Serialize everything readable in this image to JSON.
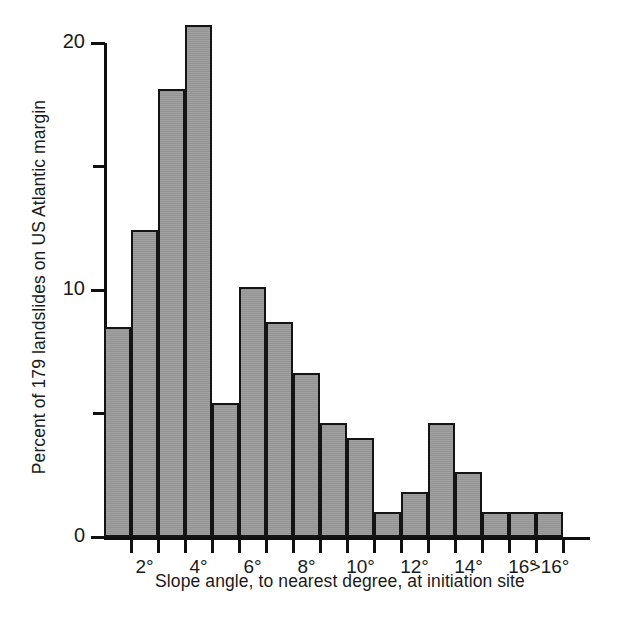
{
  "chart_data": {
    "type": "bar",
    "title": "",
    "subtitle": "",
    "xlabel": "Slope angle, to nearest degree, at initiation site",
    "ylabel": "Percent of 179 landslides on US Atlantic margin",
    "ylim": [
      0,
      21.5
    ],
    "yticks_major": [
      0,
      10,
      20
    ],
    "yticks_minor": [
      5,
      15
    ],
    "ytick_labels": [
      "0",
      "10",
      "20"
    ],
    "grid": false,
    "legend": null,
    "xtick_labels": [
      "2°",
      "4°",
      "6°",
      "8°",
      "10°",
      "12°",
      "14°",
      "16°",
      ">16°"
    ],
    "categories": [
      "1°",
      "2°",
      "3°",
      "4°",
      "5°",
      "6°",
      "7°",
      "8°",
      "9°",
      "10°",
      "11°",
      "12°",
      "13°",
      "14°",
      "15°",
      "16°",
      ">16°"
    ],
    "values": [
      8.4,
      12.3,
      18.0,
      20.6,
      5.3,
      10.0,
      8.6,
      6.5,
      4.5,
      3.9,
      0.9,
      1.7,
      4.5,
      2.5,
      0.9,
      0.9,
      0.9
    ],
    "bar_fill_color": "#9b9b9b",
    "bar_edge_color": "#141414",
    "axis_color": "#111111"
  },
  "axis": {
    "ytick_labels": [
      "0",
      "10",
      "20"
    ],
    "xtick_labels": [
      "2°",
      "4°",
      "6°",
      "8°",
      "10°",
      "12°",
      "14°",
      "16°",
      ">16°"
    ],
    "xlabel": "Slope angle, to nearest degree, at initiation site",
    "ylabel": "Percent of 179 landslides on US Atlantic margin"
  }
}
